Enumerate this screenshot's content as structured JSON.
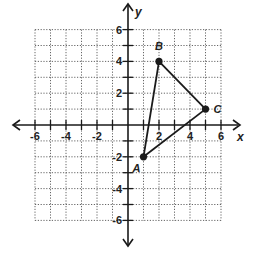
{
  "diagram": {
    "type": "coordinate-plane",
    "axes": {
      "x_label": "x",
      "y_label": "y",
      "x_range": [
        -6,
        6
      ],
      "y_range": [
        -6,
        6
      ],
      "grid_step": 1,
      "tick_labels": {
        "x": [
          {
            "value": -6,
            "text": "-6"
          },
          {
            "value": -4,
            "text": "-4"
          },
          {
            "value": -2,
            "text": "-2"
          },
          {
            "value": 2,
            "text": "2"
          },
          {
            "value": 4,
            "text": "4"
          },
          {
            "value": 6,
            "text": "6"
          }
        ],
        "y": [
          {
            "value": 6,
            "text": "6"
          },
          {
            "value": 4,
            "text": "4"
          },
          {
            "value": 2,
            "text": "2"
          },
          {
            "value": -2,
            "text": "-2"
          },
          {
            "value": -4,
            "text": "-4"
          },
          {
            "value": -6,
            "text": "-6"
          }
        ]
      }
    },
    "shape": "triangle",
    "points": [
      {
        "label": "A",
        "x": 1,
        "y": -2
      },
      {
        "label": "B",
        "x": 2,
        "y": 4
      },
      {
        "label": "C",
        "x": 5,
        "y": 1
      }
    ],
    "segments": [
      [
        "A",
        "B"
      ],
      [
        "B",
        "C"
      ],
      [
        "C",
        "A"
      ]
    ],
    "colors": {
      "axis": "#1a1a1a",
      "grid": "#555555",
      "shape": "#1a1a1a",
      "background": "#ffffff"
    }
  }
}
